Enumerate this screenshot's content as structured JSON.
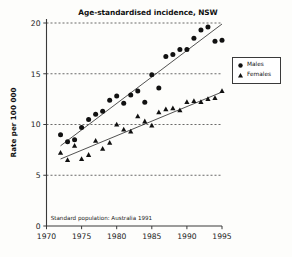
{
  "figure": {
    "title": "Age-standardised incidence, NSW",
    "y_axis_label": "Rate per 100 000",
    "annotation": "Standard population: Australia 1991",
    "background_color": "#fdfdfb",
    "ink_color": "#111111"
  },
  "legend": {
    "position": "right-outside",
    "entries": [
      {
        "label": "Males",
        "marker": "circle-marker"
      },
      {
        "label": "Females",
        "marker": "triangle-marker"
      }
    ]
  },
  "axes": {
    "x_ticks": [
      "1970",
      "1975",
      "1980",
      "1985",
      "1990",
      "1995"
    ],
    "y_ticks": [
      "0",
      "5",
      "10",
      "15",
      "20"
    ],
    "x_range": [
      1970,
      1995
    ],
    "y_range": [
      0,
      20
    ],
    "grid": "horizontal-dashed"
  },
  "chart_data": {
    "type": "scatter",
    "title": "Age-standardised incidence, NSW",
    "subtitle": "",
    "xlabel": "",
    "ylabel": "Rate per 100 000",
    "xlim": [
      1970,
      1995
    ],
    "ylim": [
      0,
      20
    ],
    "xticks": [
      1970,
      1975,
      1980,
      1985,
      1990,
      1995
    ],
    "yticks": [
      0,
      5,
      10,
      15,
      20
    ],
    "grid": true,
    "grid_axis": "y",
    "grid_style": "dashed",
    "legend_position": "right outside plot",
    "annotations": [
      {
        "text": "Standard population: Australia 1991",
        "x": 1970.6,
        "y": 0.6
      }
    ],
    "series": [
      {
        "name": "Males",
        "marker": "circle",
        "color": "#111111",
        "x": [
          1972,
          1973,
          1974,
          1975,
          1976,
          1977,
          1978,
          1979,
          1980,
          1981,
          1982,
          1983,
          1984,
          1985,
          1986,
          1987,
          1988,
          1989,
          1990,
          1991,
          1992,
          1993,
          1994,
          1995
        ],
        "values": [
          9.0,
          8.3,
          8.5,
          9.7,
          10.5,
          11.0,
          11.3,
          12.4,
          12.8,
          12.1,
          12.9,
          13.3,
          12.2,
          14.9,
          13.6,
          16.7,
          16.9,
          17.4,
          17.4,
          18.5,
          19.3,
          19.6,
          18.2,
          18.3
        ],
        "trend_line": {
          "x": [
            1972,
            1995
          ],
          "y": [
            7.9,
            19.9
          ]
        }
      },
      {
        "name": "Females",
        "marker": "triangle",
        "color": "#111111",
        "x": [
          1972,
          1973,
          1974,
          1975,
          1976,
          1977,
          1978,
          1979,
          1980,
          1981,
          1982,
          1983,
          1984,
          1985,
          1986,
          1987,
          1988,
          1989,
          1990,
          1991,
          1992,
          1993,
          1994,
          1995
        ],
        "values": [
          7.2,
          6.5,
          7.9,
          6.6,
          7.0,
          8.4,
          7.6,
          8.2,
          10.0,
          9.5,
          9.3,
          10.8,
          10.3,
          9.9,
          11.2,
          11.5,
          11.6,
          11.4,
          12.2,
          12.3,
          12.2,
          12.5,
          12.6,
          13.3
        ],
        "trend_line": {
          "x": [
            1972,
            1995
          ],
          "y": [
            6.6,
            13.2
          ]
        }
      }
    ]
  }
}
